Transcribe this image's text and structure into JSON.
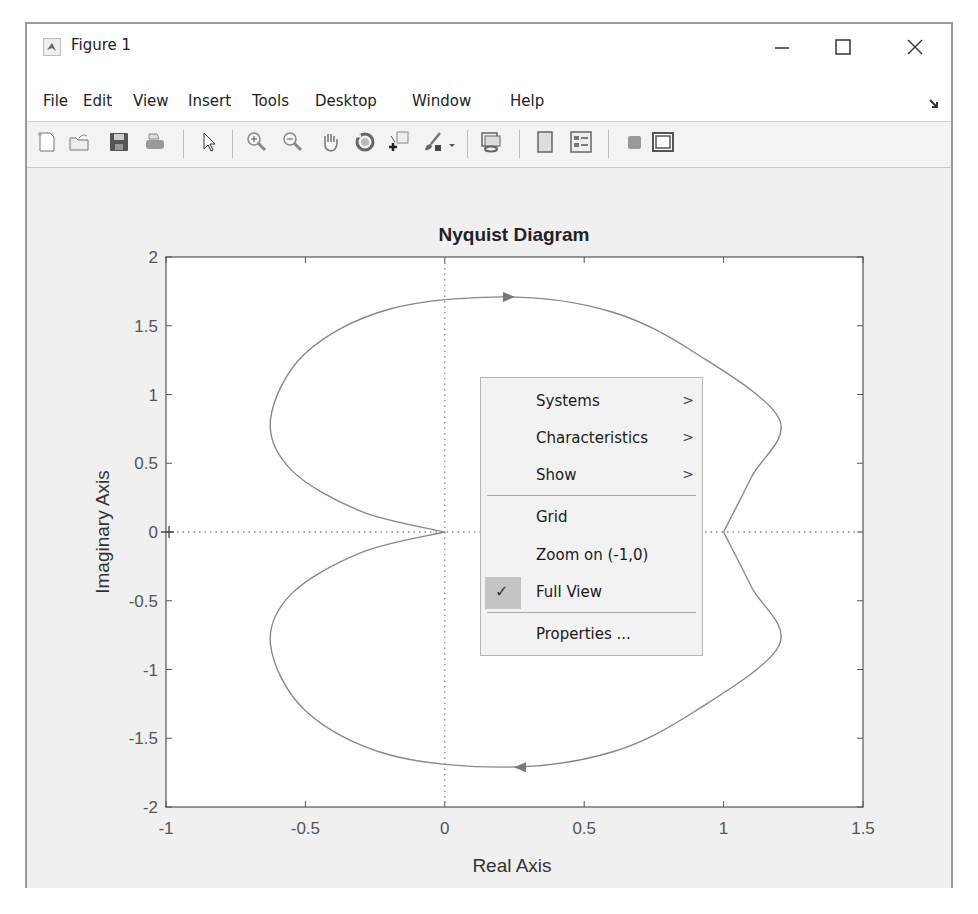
{
  "window": {
    "title": "Figure 1",
    "controls": {
      "minimize": "—",
      "maximize": "☐",
      "close": "✕"
    }
  },
  "menubar": {
    "items": [
      {
        "label": "File"
      },
      {
        "label": "Edit"
      },
      {
        "label": "View"
      },
      {
        "label": "Insert"
      },
      {
        "label": "Tools"
      },
      {
        "label": "Desktop"
      },
      {
        "label": "Window"
      },
      {
        "label": "Help"
      }
    ],
    "dock_icon": "dock-arrow-icon"
  },
  "toolbar": {
    "buttons": [
      "new-figure-icon",
      "open-file-icon",
      "save-icon",
      "print-icon",
      "pointer-icon",
      "zoom-in-icon",
      "zoom-out-icon",
      "pan-icon",
      "rotate-3d-icon",
      "data-cursor-icon",
      "brush-icon",
      "link-plot-icon",
      "hide-plot-tools-icon",
      "show-plot-tools-icon",
      "colorbar-icon",
      "legend-icon"
    ]
  },
  "chart_data": {
    "type": "line",
    "title": "Nyquist Diagram",
    "xlabel": "Real Axis",
    "ylabel": "Imaginary Axis",
    "xlim": [
      -1,
      1.5
    ],
    "ylim": [
      -2,
      2
    ],
    "xticks": [
      "-1",
      "-0.5",
      "0",
      "0.5",
      "1",
      "1.5"
    ],
    "yticks": [
      "-2",
      "-1.5",
      "-1",
      "-0.5",
      "0",
      "0.5",
      "1",
      "1.5",
      "2"
    ],
    "grid": false,
    "reference_lines": [
      "x=0 dotted",
      "y=0 dotted"
    ],
    "critical_point_marker": "+ at (-1, 0)",
    "series": [
      {
        "name": "positive frequencies",
        "x": [
          0,
          -0.3,
          -0.55,
          -0.625,
          -0.5,
          -0.2,
          0.23,
          0.6,
          0.9,
          1.2,
          1.1,
          1.0
        ],
        "y": [
          0,
          0.15,
          0.45,
          0.82,
          1.3,
          1.62,
          1.71,
          1.6,
          1.3,
          0.82,
          0.4,
          0
        ],
        "arrow": {
          "x": 0.23,
          "y": 1.71,
          "direction": "right"
        }
      },
      {
        "name": "negative frequencies",
        "x": [
          1.0,
          1.1,
          1.2,
          0.9,
          0.6,
          0.23,
          -0.2,
          -0.5,
          -0.625,
          -0.55,
          -0.3,
          0
        ],
        "y": [
          0,
          -0.4,
          -0.82,
          -1.3,
          -1.6,
          -1.71,
          -1.62,
          -1.3,
          -0.82,
          -0.45,
          -0.15,
          0
        ],
        "arrow": {
          "x": 0.27,
          "y": -1.71,
          "direction": "left"
        }
      }
    ],
    "line_color": "#888888"
  },
  "context_menu": {
    "items": [
      {
        "label": "Systems",
        "submenu": true
      },
      {
        "label": "Characteristics",
        "submenu": true
      },
      {
        "label": "Show",
        "submenu": true
      },
      {
        "label": "Grid",
        "submenu": false
      },
      {
        "label": "Zoom on (-1,0)",
        "submenu": false
      },
      {
        "label": "Full View",
        "submenu": false,
        "checked": true
      },
      {
        "label": "Properties ...",
        "submenu": false
      }
    ],
    "submenu_glyph": ">",
    "check_glyph": "✓"
  }
}
